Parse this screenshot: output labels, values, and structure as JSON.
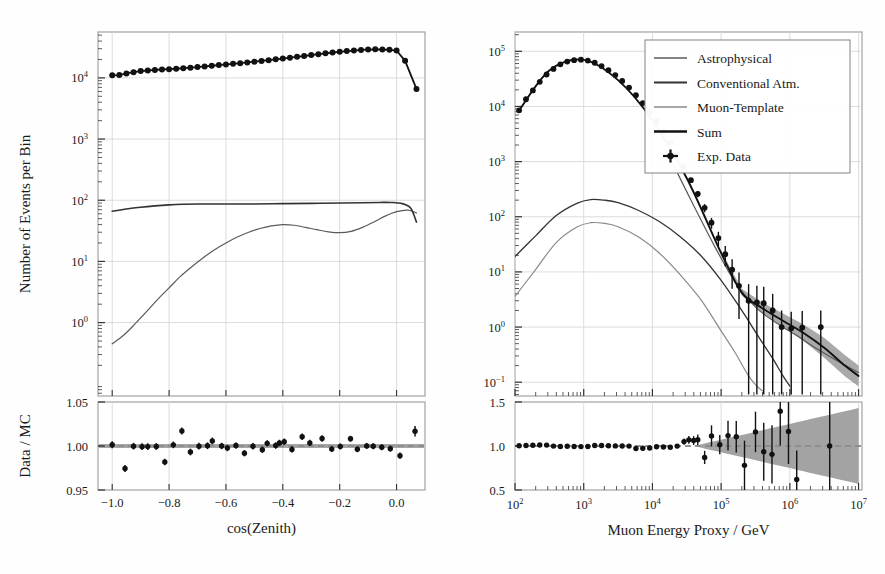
{
  "figure": {
    "background": "#fefefe",
    "panels": [
      "left-zenith-panel",
      "right-energy-panel"
    ]
  },
  "colors": {
    "astrophysical": "#5a5a5a",
    "conventional": "#333333",
    "muon_template": "#8a8a8a",
    "sum": "#111111",
    "data": "#111111",
    "band": "#8c8c8c",
    "grid": "#d8d8d8",
    "frame": "#9a9a9a"
  },
  "legend": {
    "position": "upper-right-of-right-panel",
    "entries": [
      {
        "label": "Astrophysical",
        "marker": "line",
        "color": "#5a5a5a"
      },
      {
        "label": "Conventional Atm.",
        "marker": "line",
        "color": "#333333"
      },
      {
        "label": "Muon-Template",
        "marker": "line",
        "color": "#8a8a8a"
      },
      {
        "label": "Sum",
        "marker": "line",
        "color": "#111111"
      },
      {
        "label": "Exp. Data",
        "marker": "errorbar-point",
        "color": "#111111"
      }
    ]
  },
  "chart_data": [
    {
      "id": "left-top",
      "type": "line",
      "title": "",
      "xlabel": "cos(Zenith)",
      "ylabel": "Number of Events per Bin",
      "xlim": [
        -1.05,
        0.1
      ],
      "ylim_log": [
        -1.2,
        4.75
      ],
      "yscale": "log",
      "xscale": "linear",
      "grid": true,
      "xticks": [
        -1.0,
        -0.8,
        -0.6,
        -0.4,
        -0.2,
        0.0
      ],
      "xticklabels": [
        "-1.0",
        "-0.8",
        "-0.6",
        "-0.4",
        "-0.2",
        "0.0"
      ],
      "yticks_log10": [
        0,
        1,
        2,
        3,
        4
      ],
      "yticklabels": [
        "10^0",
        "10^1",
        "10^2",
        "10^3",
        "10^4"
      ],
      "series": [
        {
          "name": "Exp. Data",
          "style": "points-with-line",
          "x": [
            -1.0,
            -0.975,
            -0.95,
            -0.925,
            -0.9,
            -0.875,
            -0.85,
            -0.825,
            -0.8,
            -0.775,
            -0.75,
            -0.725,
            -0.7,
            -0.675,
            -0.65,
            -0.625,
            -0.6,
            -0.575,
            -0.55,
            -0.525,
            -0.5,
            -0.475,
            -0.45,
            -0.425,
            -0.4,
            -0.375,
            -0.35,
            -0.325,
            -0.3,
            -0.275,
            -0.25,
            -0.225,
            -0.2,
            -0.175,
            -0.15,
            -0.125,
            -0.1,
            -0.075,
            -0.05,
            -0.025,
            0.0,
            0.03,
            0.07
          ],
          "y": [
            11000,
            11100,
            11800,
            12400,
            12900,
            13200,
            13500,
            13700,
            13900,
            14100,
            14400,
            14700,
            15000,
            15400,
            15800,
            16200,
            16600,
            17000,
            17400,
            17900,
            18400,
            18900,
            19500,
            20100,
            20700,
            21400,
            22100,
            22800,
            23600,
            24400,
            25200,
            26000,
            26700,
            27400,
            28000,
            28600,
            29000,
            29300,
            29100,
            28800,
            28000,
            19000,
            6600
          ]
        },
        {
          "name": "Conventional Atm.",
          "style": "line",
          "x": [
            -1.0,
            -0.95,
            -0.9,
            -0.85,
            -0.8,
            -0.75,
            -0.7,
            -0.6,
            -0.5,
            -0.4,
            -0.3,
            -0.2,
            -0.12,
            -0.06,
            -0.02,
            0.02,
            0.05,
            0.07
          ],
          "y": [
            66,
            72,
            77,
            81,
            84,
            86,
            87,
            87,
            87,
            88,
            89,
            90,
            91,
            92,
            92,
            88,
            74,
            44
          ]
        },
        {
          "name": "Astrophysical",
          "style": "line",
          "x": [
            -1.0,
            -0.96,
            -0.92,
            -0.88,
            -0.84,
            -0.8,
            -0.76,
            -0.72,
            -0.68,
            -0.64,
            -0.6,
            -0.56,
            -0.52,
            -0.48,
            -0.44,
            -0.4,
            -0.36,
            -0.32,
            -0.28,
            -0.24,
            -0.2,
            -0.16,
            -0.12,
            -0.08,
            -0.04,
            0.0,
            0.04,
            0.07
          ],
          "y": [
            0.45,
            0.62,
            0.95,
            1.5,
            2.4,
            3.7,
            5.7,
            8.2,
            11.5,
            15.5,
            20.0,
            25.0,
            30.0,
            34.5,
            38.0,
            40.0,
            39.0,
            36.0,
            33.0,
            30.5,
            29.5,
            31.0,
            36.0,
            44.0,
            55.0,
            65.0,
            69.0,
            62.0
          ]
        }
      ]
    },
    {
      "id": "left-ratio",
      "type": "scatter",
      "xlabel": "cos(Zenith)",
      "ylabel": "Data / MC",
      "xlim": [
        -1.05,
        0.1
      ],
      "ylim": [
        0.95,
        1.05
      ],
      "yticks": [
        0.95,
        1.0,
        1.05
      ],
      "yticklabels": [
        "0.95",
        "1.00",
        "1.05"
      ],
      "xticks": [
        -1.0,
        -0.8,
        -0.6,
        -0.4,
        -0.2,
        0.0
      ],
      "reference_line": 1.0,
      "grid": true,
      "band_halfwidth": 0.0022,
      "points": [
        {
          "x": -1.0,
          "y": 1.0015,
          "err": 0.004
        },
        {
          "x": -0.955,
          "y": 0.9745,
          "err": 0.004
        },
        {
          "x": -0.925,
          "y": 0.9998,
          "err": 0.0038
        },
        {
          "x": -0.895,
          "y": 0.9992,
          "err": 0.0038
        },
        {
          "x": -0.875,
          "y": 0.9993,
          "err": 0.0038
        },
        {
          "x": -0.845,
          "y": 0.9995,
          "err": 0.0038
        },
        {
          "x": -0.815,
          "y": 0.9818,
          "err": 0.0038
        },
        {
          "x": -0.785,
          "y": 1.0013,
          "err": 0.0038
        },
        {
          "x": -0.755,
          "y": 1.017,
          "err": 0.004
        },
        {
          "x": -0.725,
          "y": 0.9932,
          "err": 0.0038
        },
        {
          "x": -0.695,
          "y": 0.9998,
          "err": 0.0038
        },
        {
          "x": -0.665,
          "y": 1.0003,
          "err": 0.0038
        },
        {
          "x": -0.648,
          "y": 1.0058,
          "err": 0.0038
        },
        {
          "x": -0.615,
          "y": 1.0,
          "err": 0.0036
        },
        {
          "x": -0.595,
          "y": 0.9977,
          "err": 0.0036
        },
        {
          "x": -0.565,
          "y": 1.0005,
          "err": 0.0036
        },
        {
          "x": -0.535,
          "y": 0.9918,
          "err": 0.0036
        },
        {
          "x": -0.505,
          "y": 0.9997,
          "err": 0.0036
        },
        {
          "x": -0.472,
          "y": 0.9957,
          "err": 0.0036
        },
        {
          "x": -0.455,
          "y": 1.003,
          "err": 0.0036
        },
        {
          "x": -0.425,
          "y": 1.0005,
          "err": 0.0036
        },
        {
          "x": -0.412,
          "y": 1.0035,
          "err": 0.0036
        },
        {
          "x": -0.395,
          "y": 1.0048,
          "err": 0.0036
        },
        {
          "x": -0.368,
          "y": 0.9961,
          "err": 0.0036
        },
        {
          "x": -0.332,
          "y": 1.0105,
          "err": 0.0036
        },
        {
          "x": -0.305,
          "y": 1.0035,
          "err": 0.0036
        },
        {
          "x": -0.262,
          "y": 1.0085,
          "err": 0.0036
        },
        {
          "x": -0.228,
          "y": 0.9965,
          "err": 0.0034
        },
        {
          "x": -0.198,
          "y": 0.9995,
          "err": 0.0034
        },
        {
          "x": -0.162,
          "y": 1.0082,
          "err": 0.0034
        },
        {
          "x": -0.138,
          "y": 0.9963,
          "err": 0.0034
        },
        {
          "x": -0.105,
          "y": 1.0001,
          "err": 0.0034
        },
        {
          "x": -0.082,
          "y": 0.9998,
          "err": 0.0034
        },
        {
          "x": -0.052,
          "y": 0.9985,
          "err": 0.0034
        },
        {
          "x": -0.022,
          "y": 0.997,
          "err": 0.0034
        },
        {
          "x": 0.012,
          "y": 0.989,
          "err": 0.0036
        },
        {
          "x": 0.065,
          "y": 1.0168,
          "err": 0.006
        }
      ]
    },
    {
      "id": "right-top",
      "type": "line",
      "xlabel": "Muon Energy Proxy / GeV",
      "ylabel": "Number of Events per Bin",
      "xscale": "log",
      "yscale": "log",
      "xlim_log": [
        2.0,
        7.05
      ],
      "ylim_log": [
        -1.25,
        5.35
      ],
      "grid": true,
      "xticks_log10": [
        2,
        3,
        4,
        5,
        6,
        7
      ],
      "xticklabels": [
        "10^2",
        "10^3",
        "10^4",
        "10^5",
        "10^6",
        "10^7"
      ],
      "yticks_log10": [
        -1,
        0,
        1,
        2,
        3,
        4,
        5
      ],
      "yticklabels": [
        "10^-1",
        "10^0",
        "10^1",
        "10^2",
        "10^3",
        "10^4",
        "10^5"
      ],
      "series": [
        {
          "name": "Exp. Data",
          "style": "points-with-errorbars",
          "x_log10": [
            2.06,
            2.16,
            2.26,
            2.36,
            2.46,
            2.56,
            2.66,
            2.76,
            2.86,
            2.96,
            3.06,
            3.16,
            3.26,
            3.36,
            3.46,
            3.56,
            3.66,
            3.76,
            3.86,
            3.96,
            4.06,
            4.16,
            4.26,
            4.36,
            4.46,
            4.56,
            4.66,
            4.76,
            4.86,
            4.96,
            5.06,
            5.16,
            5.26,
            5.4,
            5.52,
            5.62,
            5.75,
            5.88,
            6.02,
            6.18,
            6.45
          ],
          "y": [
            8500,
            13500,
            19500,
            28000,
            38000,
            48000,
            58000,
            65000,
            69000,
            70500,
            68000,
            62000,
            54000,
            45500,
            37000,
            29000,
            22000,
            16000,
            11500,
            8000,
            5400,
            3500,
            2200,
            1350,
            800,
            460,
            260,
            145,
            78,
            41,
            21,
            11,
            5.6,
            3.0,
            2.8,
            2.7,
            2.0,
            1.0,
            0.95,
            0.98,
            1.0
          ],
          "yerr_rel": [
            0.02,
            0.02,
            0.02,
            0.02,
            0.02,
            0.02,
            0.02,
            0.02,
            0.02,
            0.02,
            0.02,
            0.02,
            0.02,
            0.02,
            0.02,
            0.02,
            0.02,
            0.02,
            0.02,
            0.03,
            0.03,
            0.04,
            0.05,
            0.06,
            0.08,
            0.1,
            0.13,
            0.17,
            0.22,
            0.3,
            0.4,
            0.55,
            0.75,
            1.0,
            1.0,
            1.0,
            1.0,
            1.0,
            1.0,
            1.0,
            1.0
          ]
        },
        {
          "name": "Sum",
          "style": "line-thick",
          "x_log10": [
            2.06,
            2.5,
            3.0,
            3.5,
            4.0,
            4.5,
            5.0,
            5.3,
            5.6,
            5.9,
            6.2,
            6.5,
            6.8,
            7.0
          ],
          "y": [
            8500,
            45000,
            70000,
            30000,
            5600,
            500,
            22,
            4.2,
            2.2,
            1.3,
            0.78,
            0.42,
            0.2,
            0.13
          ]
        },
        {
          "name": "Conventional Atm.",
          "style": "line",
          "x_log10": [
            2.0,
            2.3,
            2.6,
            2.9,
            3.1,
            3.3,
            3.5,
            3.8,
            4.1,
            4.4,
            4.7,
            5.0,
            5.3,
            5.55,
            5.75,
            5.9,
            6.0
          ],
          "y": [
            19,
            45,
            105,
            175,
            205,
            200,
            180,
            130,
            82,
            44,
            20,
            7.0,
            2.0,
            0.65,
            0.27,
            0.13,
            0.085
          ]
        },
        {
          "name": "Muon-Template",
          "style": "line",
          "x_log10": [
            2.0,
            2.3,
            2.6,
            2.9,
            3.1,
            3.3,
            3.5,
            3.8,
            4.1,
            4.4,
            4.7,
            5.0,
            5.2,
            5.4,
            5.52,
            5.6
          ],
          "y": [
            3.6,
            11,
            34,
            65,
            78,
            76,
            66,
            43,
            22,
            9.0,
            3.2,
            0.85,
            0.35,
            0.13,
            0.085,
            0.07
          ]
        },
        {
          "name": "Astrophysical",
          "style": "line",
          "x_log10": [
            4.3,
            4.6,
            4.9,
            5.2,
            5.5,
            5.8,
            6.1,
            6.4,
            6.7,
            7.0
          ],
          "y": [
            900,
            160,
            30,
            6.6,
            2.3,
            1.2,
            0.7,
            0.4,
            0.24,
            0.15
          ]
        }
      ]
    },
    {
      "id": "right-ratio",
      "type": "scatter",
      "xlabel": "Muon Energy Proxy / GeV",
      "ylabel": "Data / MC",
      "xscale": "log",
      "xlim_log": [
        2.0,
        7.05
      ],
      "ylim": [
        0.5,
        1.5
      ],
      "yticks": [
        0.5,
        1.0,
        1.5
      ],
      "yticklabels": [
        "0.5",
        "1.0",
        "1.5"
      ],
      "xticks_log10": [
        2,
        3,
        4,
        5,
        6,
        7
      ],
      "xticklabels": [
        "10^2",
        "10^3",
        "10^4",
        "10^5",
        "10^6",
        "10^7"
      ],
      "reference_line": 1.0,
      "grid": true,
      "band_start_log10": 4.6,
      "band_max_halfwidth": 0.44,
      "points": [
        {
          "x_log10": 2.06,
          "y": 1.003,
          "err": 0.012
        },
        {
          "x_log10": 2.16,
          "y": 1.005,
          "err": 0.012
        },
        {
          "x_log10": 2.26,
          "y": 1.008,
          "err": 0.012
        },
        {
          "x_log10": 2.36,
          "y": 1.012,
          "err": 0.012
        },
        {
          "x_log10": 2.46,
          "y": 1.01,
          "err": 0.012
        },
        {
          "x_log10": 2.56,
          "y": 0.999,
          "err": 0.012
        },
        {
          "x_log10": 2.66,
          "y": 0.995,
          "err": 0.012
        },
        {
          "x_log10": 2.76,
          "y": 0.997,
          "err": 0.012
        },
        {
          "x_log10": 2.86,
          "y": 0.994,
          "err": 0.012
        },
        {
          "x_log10": 2.96,
          "y": 0.993,
          "err": 0.012
        },
        {
          "x_log10": 3.06,
          "y": 0.995,
          "err": 0.012
        },
        {
          "x_log10": 3.16,
          "y": 1.006,
          "err": 0.012
        },
        {
          "x_log10": 3.26,
          "y": 1.005,
          "err": 0.012
        },
        {
          "x_log10": 3.36,
          "y": 1.003,
          "err": 0.012
        },
        {
          "x_log10": 3.46,
          "y": 1.001,
          "err": 0.012
        },
        {
          "x_log10": 3.56,
          "y": 1.0,
          "err": 0.012
        },
        {
          "x_log10": 3.66,
          "y": 0.999,
          "err": 0.012
        },
        {
          "x_log10": 3.76,
          "y": 0.971,
          "err": 0.014
        },
        {
          "x_log10": 3.86,
          "y": 0.975,
          "err": 0.014
        },
        {
          "x_log10": 3.96,
          "y": 0.978,
          "err": 0.016
        },
        {
          "x_log10": 4.06,
          "y": 0.992,
          "err": 0.016
        },
        {
          "x_log10": 4.16,
          "y": 0.988,
          "err": 0.018
        },
        {
          "x_log10": 4.26,
          "y": 0.986,
          "err": 0.02
        },
        {
          "x_log10": 4.36,
          "y": 0.999,
          "err": 0.024
        },
        {
          "x_log10": 4.46,
          "y": 1.05,
          "err": 0.035
        },
        {
          "x_log10": 4.53,
          "y": 1.07,
          "err": 0.045
        },
        {
          "x_log10": 4.6,
          "y": 1.062,
          "err": 0.05
        },
        {
          "x_log10": 4.66,
          "y": 1.072,
          "err": 0.06
        },
        {
          "x_log10": 4.76,
          "y": 0.87,
          "err": 0.075
        },
        {
          "x_log10": 4.86,
          "y": 1.115,
          "err": 0.12
        },
        {
          "x_log10": 4.98,
          "y": 1.015,
          "err": 0.11
        },
        {
          "x_log10": 5.1,
          "y": 1.118,
          "err": 0.17
        },
        {
          "x_log10": 5.22,
          "y": 1.105,
          "err": 0.18
        },
        {
          "x_log10": 5.34,
          "y": 0.78,
          "err": 0.28
        },
        {
          "x_log10": 5.5,
          "y": 1.16,
          "err": 0.23
        },
        {
          "x_log10": 5.62,
          "y": 0.935,
          "err": 0.33
        },
        {
          "x_log10": 5.74,
          "y": 0.905,
          "err": 0.33
        },
        {
          "x_log10": 5.86,
          "y": 1.395,
          "err": 0.39
        },
        {
          "x_log10": 5.98,
          "y": 1.165,
          "err": 0.37
        },
        {
          "x_log10": 6.1,
          "y": 0.62,
          "err": 0.33
        },
        {
          "x_log10": 6.58,
          "y": 1.0,
          "err": 0.5
        }
      ]
    }
  ]
}
